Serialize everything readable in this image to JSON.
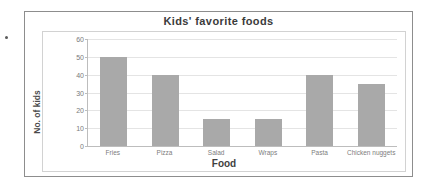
{
  "chart_data": {
    "type": "bar",
    "title": "Kids' favorite foods",
    "xlabel": "Food",
    "ylabel": "No. of kids",
    "categories": [
      "Fries",
      "Pizza",
      "Salad",
      "Wraps",
      "Pasta",
      "Chicken nuggets"
    ],
    "values": [
      50,
      40,
      15,
      15,
      40,
      35
    ],
    "ylim": [
      0,
      60
    ],
    "yticks": [
      0,
      10,
      20,
      30,
      40,
      50,
      60
    ],
    "ytick_labels": [
      "0",
      "10",
      "20",
      "30",
      "40",
      "50",
      "60"
    ],
    "grid": true,
    "legend": "none",
    "bar_color": "#a9a9a9"
  }
}
